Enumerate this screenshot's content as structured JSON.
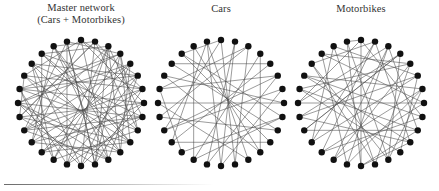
{
  "figure": {
    "background_color": "#ffffff",
    "node_color": "#111111",
    "edge_color": "#4a4a4a",
    "rule_color": "#6b6b6b"
  },
  "panels": [
    {
      "id": "master-network",
      "title": "Master network\n(Cars + Motorbikes)",
      "title_line_1": "Master network",
      "title_line_2": "(Cars + Motorbikes)",
      "node_count": 28,
      "edge_count": 78
    },
    {
      "id": "cars",
      "title": "Cars",
      "title_line_1": "Cars",
      "title_line_2": "",
      "node_count": 28,
      "edge_count": 34
    },
    {
      "id": "motorbikes",
      "title": "Motorbikes",
      "title_line_1": "Motorbikes",
      "title_line_2": "",
      "node_count": 28,
      "edge_count": 47
    }
  ],
  "chart_data": {
    "type": "network",
    "layout": "circular",
    "node_count_per_graph": 28,
    "graphs": [
      {
        "name": "Master network (Cars + Motorbikes)",
        "nodes": 28,
        "edges": [
          [
            0,
            7
          ],
          [
            0,
            12
          ],
          [
            0,
            18
          ],
          [
            0,
            23
          ],
          [
            1,
            9
          ],
          [
            1,
            14
          ],
          [
            1,
            20
          ],
          [
            1,
            26
          ],
          [
            2,
            8
          ],
          [
            2,
            13
          ],
          [
            2,
            19
          ],
          [
            2,
            25
          ],
          [
            3,
            10
          ],
          [
            3,
            16
          ],
          [
            3,
            22
          ],
          [
            3,
            27
          ],
          [
            4,
            11
          ],
          [
            4,
            17
          ],
          [
            4,
            21
          ],
          [
            5,
            12
          ],
          [
            5,
            18
          ],
          [
            5,
            24
          ],
          [
            6,
            13
          ],
          [
            6,
            19
          ],
          [
            6,
            25
          ],
          [
            7,
            14
          ],
          [
            7,
            20
          ],
          [
            8,
            15
          ],
          [
            8,
            21
          ],
          [
            9,
            16
          ],
          [
            9,
            22
          ],
          [
            10,
            17
          ],
          [
            10,
            23
          ],
          [
            11,
            18
          ],
          [
            11,
            24
          ],
          [
            12,
            19
          ],
          [
            12,
            26
          ],
          [
            13,
            20
          ],
          [
            13,
            27
          ],
          [
            14,
            21
          ],
          [
            15,
            22
          ],
          [
            15,
            2
          ],
          [
            16,
            24
          ],
          [
            17,
            25
          ],
          [
            18,
            26
          ],
          [
            19,
            27
          ],
          [
            20,
            1
          ],
          [
            21,
            3
          ],
          [
            22,
            5
          ],
          [
            23,
            6
          ],
          [
            24,
            8
          ],
          [
            25,
            10
          ],
          [
            26,
            11
          ],
          [
            27,
            13
          ],
          [
            0,
            5
          ],
          [
            1,
            6
          ],
          [
            2,
            11
          ],
          [
            3,
            9
          ],
          [
            4,
            14
          ],
          [
            5,
            15
          ],
          [
            6,
            17
          ],
          [
            7,
            22
          ],
          [
            8,
            19
          ],
          [
            9,
            25
          ],
          [
            10,
            26
          ],
          [
            11,
            21
          ],
          [
            12,
            23
          ],
          [
            13,
            3
          ],
          [
            14,
            24
          ],
          [
            15,
            27
          ],
          [
            16,
            2
          ],
          [
            17,
            7
          ],
          [
            18,
            8
          ],
          [
            19,
            4
          ],
          [
            20,
            10
          ],
          [
            21,
            12
          ],
          [
            22,
            16
          ],
          [
            23,
            20
          ]
        ]
      },
      {
        "name": "Cars",
        "nodes": 28,
        "edges": [
          [
            0,
            13
          ],
          [
            0,
            19
          ],
          [
            1,
            15
          ],
          [
            2,
            20
          ],
          [
            3,
            11
          ],
          [
            4,
            18
          ],
          [
            5,
            22
          ],
          [
            6,
            14
          ],
          [
            7,
            21
          ],
          [
            8,
            16
          ],
          [
            9,
            24
          ],
          [
            10,
            25
          ],
          [
            11,
            26
          ],
          [
            12,
            27
          ],
          [
            13,
            2
          ],
          [
            14,
            1
          ],
          [
            15,
            5
          ],
          [
            16,
            3
          ],
          [
            17,
            8
          ],
          [
            18,
            10
          ],
          [
            19,
            6
          ],
          [
            20,
            9
          ],
          [
            21,
            12
          ],
          [
            22,
            17
          ],
          [
            23,
            7
          ],
          [
            24,
            4
          ],
          [
            25,
            0
          ],
          [
            26,
            16
          ],
          [
            27,
            18
          ],
          [
            2,
            22
          ],
          [
            5,
            19
          ],
          [
            8,
            25
          ],
          [
            11,
            23
          ],
          [
            14,
            27
          ]
        ]
      },
      {
        "name": "Motorbikes",
        "nodes": 28,
        "edges": [
          [
            0,
            8
          ],
          [
            0,
            14
          ],
          [
            0,
            21
          ],
          [
            1,
            10
          ],
          [
            1,
            17
          ],
          [
            1,
            24
          ],
          [
            2,
            9
          ],
          [
            2,
            16
          ],
          [
            3,
            12
          ],
          [
            3,
            20
          ],
          [
            4,
            13
          ],
          [
            4,
            22
          ],
          [
            5,
            11
          ],
          [
            5,
            18
          ],
          [
            6,
            15
          ],
          [
            6,
            23
          ],
          [
            7,
            16
          ],
          [
            7,
            25
          ],
          [
            8,
            17
          ],
          [
            9,
            19
          ],
          [
            10,
            20
          ],
          [
            11,
            22
          ],
          [
            12,
            24
          ],
          [
            13,
            26
          ],
          [
            14,
            27
          ],
          [
            15,
            2
          ],
          [
            16,
            4
          ],
          [
            17,
            6
          ],
          [
            18,
            1
          ],
          [
            19,
            3
          ],
          [
            20,
            5
          ],
          [
            21,
            7
          ],
          [
            22,
            9
          ],
          [
            23,
            10
          ],
          [
            24,
            13
          ],
          [
            25,
            15
          ],
          [
            26,
            18
          ],
          [
            27,
            0
          ],
          [
            2,
            21
          ],
          [
            4,
            25
          ],
          [
            6,
            12
          ],
          [
            8,
            23
          ],
          [
            10,
            14
          ],
          [
            12,
            27
          ],
          [
            3,
            19
          ],
          [
            5,
            26
          ],
          [
            9,
            14
          ]
        ]
      }
    ]
  }
}
